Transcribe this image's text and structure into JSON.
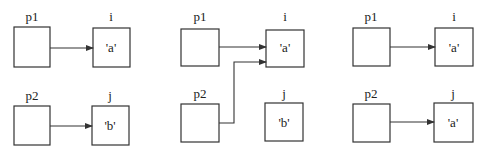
{
  "diagram": {
    "colors": {
      "stroke": "#333333",
      "background": "#ffffff",
      "text": "#222222"
    },
    "panels": [
      {
        "pointers": [
          {
            "label": "p1",
            "target": "i"
          },
          {
            "label": "p2",
            "target": "j"
          }
        ],
        "variables": [
          {
            "label": "i",
            "value": "'a'"
          },
          {
            "label": "j",
            "value": "'b'"
          }
        ]
      },
      {
        "pointers": [
          {
            "label": "p1",
            "target": "i"
          },
          {
            "label": "p2",
            "target": "i"
          }
        ],
        "variables": [
          {
            "label": "i",
            "value": "'a'"
          },
          {
            "label": "j",
            "value": "'b'"
          }
        ]
      },
      {
        "pointers": [
          {
            "label": "p1",
            "target": "i"
          },
          {
            "label": "p2",
            "target": "j"
          }
        ],
        "variables": [
          {
            "label": "i",
            "value": "'a'"
          },
          {
            "label": "j",
            "value": "'a'"
          }
        ]
      }
    ]
  }
}
